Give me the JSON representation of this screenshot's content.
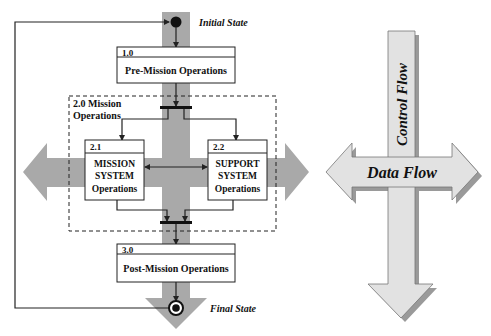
{
  "colors": {
    "band": "#a9a9a9",
    "line": "#222222",
    "box_fill": "#ffffff",
    "legend_fill": "#e2e2e2",
    "legend_shadow": "#9a9a9a"
  },
  "diagram": {
    "initial_state": {
      "label": "Initial State"
    },
    "final_state": {
      "label": "Final State"
    },
    "nodes": [
      {
        "id": "1.0",
        "title": "Pre-Mission Operations"
      },
      {
        "id": "2.1",
        "lines": [
          "MISSION",
          "SYSTEM",
          "Operations"
        ]
      },
      {
        "id": "2.2",
        "lines": [
          "SUPPORT",
          "SYSTEM",
          "Operations"
        ]
      },
      {
        "id": "3.0",
        "title": "Post-Mission Operations"
      }
    ],
    "group": {
      "id_label": "2.0 Mission",
      "label_line2": "Operations"
    }
  },
  "legend": {
    "control_flow": "Control Flow",
    "data_flow": "Data Flow"
  }
}
